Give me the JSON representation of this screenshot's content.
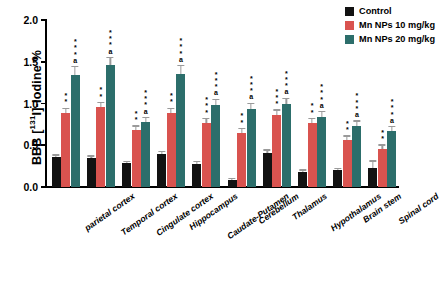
{
  "chart_data": {
    "type": "bar",
    "title": "",
    "xlabel": "",
    "ylabel": "BBB [131I]-Iodine %",
    "ylabel_prefix": "BBB [",
    "ylabel_sup": "131",
    "ylabel_suffix": "I]-Iodine %",
    "ylim": [
      0,
      2.0
    ],
    "yticks": [
      0.0,
      0.5,
      1.0,
      1.5,
      2.0
    ],
    "ytick_labels": [
      "0.0",
      "0.5",
      "1.0",
      "1.5",
      "2.0"
    ],
    "grid": false,
    "legend_position": "top-right",
    "categories": [
      "parietal cortex",
      "Temporal cortex",
      "Cingulate cortex",
      "Hippocampus",
      "Caudate-Putamen",
      "Cerebellum",
      "Thalamus",
      "Hypothalamus",
      "Brain stem",
      "Spinal cord"
    ],
    "series": [
      {
        "name": "Control",
        "color": "#121212",
        "values": [
          0.36,
          0.35,
          0.29,
          0.39,
          0.28,
          0.09,
          0.41,
          0.18,
          0.2,
          0.23
        ],
        "errors": [
          0.03,
          0.03,
          0.02,
          0.04,
          0.03,
          0.02,
          0.04,
          0.03,
          0.03,
          0.09
        ],
        "annotations": [
          "",
          "",
          "",
          "",
          "",
          "",
          "",
          "",
          "",
          ""
        ]
      },
      {
        "name": "Mn NPs 10 mg/kg",
        "color": "#d9534f",
        "values": [
          0.89,
          0.96,
          0.68,
          0.89,
          0.77,
          0.65,
          0.86,
          0.77,
          0.56,
          0.45
        ],
        "errors": [
          0.06,
          0.06,
          0.06,
          0.06,
          0.06,
          0.06,
          0.07,
          0.06,
          0.06,
          0.06
        ],
        "annotations": [
          "**",
          "**",
          "**",
          "**",
          "***",
          "**",
          "***",
          "**",
          "**",
          "**"
        ]
      },
      {
        "name": "Mn NPs 20 mg/kg",
        "color": "#2c6e6b",
        "values": [
          1.34,
          1.46,
          0.78,
          1.35,
          0.98,
          0.93,
          0.99,
          0.84,
          0.73,
          0.67
        ],
        "errors": [
          0.11,
          0.1,
          0.06,
          0.11,
          0.08,
          0.08,
          0.08,
          0.07,
          0.07,
          0.06
        ],
        "annotations": [
          "a***",
          "a***",
          "a***",
          "a***",
          "a***",
          "a***",
          "a***",
          "a***",
          "a***",
          "a***"
        ]
      }
    ]
  },
  "legend": {
    "items": [
      {
        "label": "Control",
        "color": "#121212"
      },
      {
        "label": "Mn NPs 10 mg/kg",
        "color": "#d9534f"
      },
      {
        "label": "Mn NPs 20 mg/kg",
        "color": "#2c6e6b"
      }
    ]
  }
}
